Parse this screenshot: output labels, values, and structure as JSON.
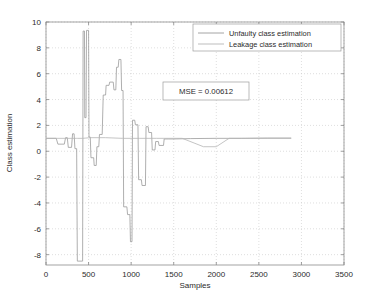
{
  "figure": {
    "partial_header_text": "",
    "background_color": "#ffffff"
  },
  "chart_data": {
    "type": "line",
    "title": "",
    "xlabel": "Samples",
    "ylabel": "Class estimation",
    "xlim": [
      0,
      3500
    ],
    "ylim": [
      -8.8,
      10
    ],
    "xticks": [
      0,
      500,
      1000,
      1500,
      2000,
      2500,
      3000,
      3500
    ],
    "yticks": [
      -8,
      -6,
      -4,
      -2,
      0,
      2,
      4,
      6,
      8,
      10
    ],
    "xticklabels": [
      "0",
      "500",
      "1000",
      "1500",
      "2000",
      "2500",
      "3000",
      "3500"
    ],
    "yticklabels": [
      "-8",
      "-6",
      "-4",
      "-2",
      "0",
      "2",
      "4",
      "6",
      "8",
      "10"
    ],
    "grid": true,
    "grid_color": "#c8c8c8",
    "legend_position": "top-right",
    "annotations": [
      {
        "name": "mse-annotation",
        "text": "MSE = 0.00612",
        "x": 1700,
        "y": 4.0,
        "boxed": true
      }
    ],
    "series": [
      {
        "name": "Unfaulty class estimation",
        "color": "#9a9a9a",
        "linewidth": 0.8,
        "points": [
          [
            0,
            1.0
          ],
          [
            120,
            1.0
          ],
          [
            140,
            0.55
          ],
          [
            215,
            0.55
          ],
          [
            230,
            1.05
          ],
          [
            250,
            1.05
          ],
          [
            262,
            0.3
          ],
          [
            300,
            0.3
          ],
          [
            312,
            1.35
          ],
          [
            330,
            1.35
          ],
          [
            340,
            0.2
          ],
          [
            360,
            0.2
          ],
          [
            368,
            -8.5
          ],
          [
            430,
            -8.5
          ],
          [
            436,
            9.3
          ],
          [
            452,
            9.3
          ],
          [
            455,
            2.6
          ],
          [
            470,
            2.6
          ],
          [
            476,
            9.35
          ],
          [
            500,
            9.35
          ],
          [
            505,
            1.1
          ],
          [
            520,
            1.1
          ],
          [
            528,
            -0.5
          ],
          [
            560,
            -0.5
          ],
          [
            566,
            -1.1
          ],
          [
            590,
            -1.1
          ],
          [
            598,
            0.35
          ],
          [
            620,
            0.35
          ],
          [
            628,
            1.3
          ],
          [
            660,
            1.3
          ],
          [
            672,
            4.35
          ],
          [
            700,
            4.35
          ],
          [
            706,
            5.1
          ],
          [
            740,
            5.1
          ],
          [
            748,
            5.35
          ],
          [
            790,
            5.35
          ],
          [
            798,
            4.75
          ],
          [
            820,
            4.75
          ],
          [
            828,
            6.5
          ],
          [
            848,
            6.5
          ],
          [
            856,
            7.1
          ],
          [
            880,
            7.1
          ],
          [
            888,
            4.7
          ],
          [
            905,
            4.7
          ],
          [
            912,
            -4.3
          ],
          [
            950,
            -4.3
          ],
          [
            958,
            -4.9
          ],
          [
            985,
            -4.9
          ],
          [
            992,
            -7.0
          ],
          [
            1010,
            -7.0
          ],
          [
            1016,
            2.4
          ],
          [
            1042,
            2.4
          ],
          [
            1050,
            2.05
          ],
          [
            1080,
            2.05
          ],
          [
            1088,
            -2.2
          ],
          [
            1120,
            -2.2
          ],
          [
            1128,
            -2.65
          ],
          [
            1168,
            -2.65
          ],
          [
            1175,
            1.9
          ],
          [
            1200,
            1.9
          ],
          [
            1208,
            1.45
          ],
          [
            1240,
            1.45
          ],
          [
            1248,
            0.1
          ],
          [
            1280,
            0.1
          ],
          [
            1288,
            0.75
          ],
          [
            1320,
            0.75
          ],
          [
            1328,
            0.45
          ],
          [
            1380,
            0.45
          ],
          [
            1388,
            0.95
          ],
          [
            1440,
            0.95
          ],
          [
            1500,
            0.95
          ],
          [
            1700,
            0.98
          ],
          [
            2000,
            1.0
          ],
          [
            2300,
            1.0
          ],
          [
            2600,
            1.02
          ],
          [
            2880,
            1.02
          ]
        ]
      },
      {
        "name": "Leakage class estimation",
        "color": "#b5b5b5",
        "linewidth": 0.8,
        "points": [
          [
            0,
            1.0
          ],
          [
            100,
            1.0
          ],
          [
            130,
            1.0
          ],
          [
            360,
            1.0
          ],
          [
            368,
            1.0
          ],
          [
            430,
            1.0
          ],
          [
            520,
            1.05
          ],
          [
            700,
            1.05
          ],
          [
            900,
            1.0
          ],
          [
            1010,
            1.0
          ],
          [
            1100,
            1.0
          ],
          [
            1300,
            1.0
          ],
          [
            1600,
            1.0
          ],
          [
            1850,
            0.35
          ],
          [
            2000,
            0.35
          ],
          [
            2150,
            1.0
          ],
          [
            2400,
            1.0
          ],
          [
            2880,
            1.0
          ]
        ]
      }
    ],
    "legend_entries": [
      {
        "label": "Unfaulty class estimation",
        "color": "#9a9a9a"
      },
      {
        "label": "Leakage class estimation",
        "color": "#b5b5b5"
      }
    ]
  }
}
